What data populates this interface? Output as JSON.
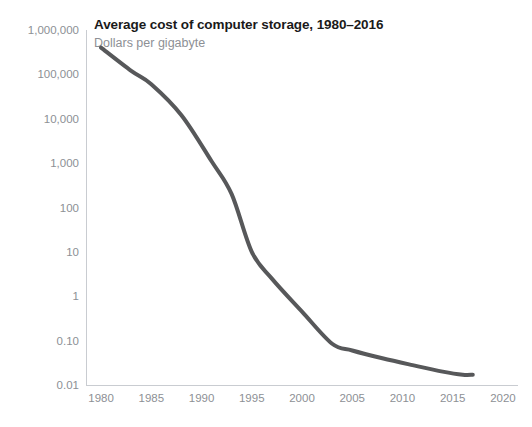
{
  "chart_data": {
    "type": "line",
    "title": "Average cost of computer storage, 1980–2016",
    "subtitle": "Dollars per gigabyte",
    "xlabel": "",
    "ylabel": "",
    "yscale": "log",
    "ylim": [
      0.01,
      1000000
    ],
    "xlim": [
      1978.5,
      2021.5
    ],
    "grid": false,
    "legend": null,
    "line_color": "#57585a",
    "line_width": 4,
    "y_ticks": [
      {
        "value": 1000000,
        "label": "1,000,000"
      },
      {
        "value": 100000,
        "label": "100,000"
      },
      {
        "value": 10000,
        "label": "10,000"
      },
      {
        "value": 1000,
        "label": "1,000"
      },
      {
        "value": 100,
        "label": "100"
      },
      {
        "value": 10,
        "label": "10"
      },
      {
        "value": 1,
        "label": "1"
      },
      {
        "value": 0.1,
        "label": "0.10"
      },
      {
        "value": 0.01,
        "label": "0.01"
      }
    ],
    "x_ticks": [
      {
        "value": 1980,
        "label": "1980"
      },
      {
        "value": 1985,
        "label": "1985"
      },
      {
        "value": 1990,
        "label": "1990"
      },
      {
        "value": 1995,
        "label": "1995"
      },
      {
        "value": 2000,
        "label": "2000"
      },
      {
        "value": 2005,
        "label": "2005"
      },
      {
        "value": 2010,
        "label": "2010"
      },
      {
        "value": 2015,
        "label": "2015"
      },
      {
        "value": 2020,
        "label": "2020"
      }
    ],
    "series": [
      {
        "name": "Average cost per gigabyte",
        "x": [
          1980,
          1983,
          1985,
          1988,
          1991,
          1993,
          1995,
          1997,
          2000,
          2003,
          2005,
          2008,
          2011,
          2014,
          2016,
          2017
        ],
        "y": [
          400000,
          120000,
          60000,
          12000,
          1100,
          200,
          10,
          2.5,
          0.45,
          0.085,
          0.06,
          0.04,
          0.028,
          0.02,
          0.017,
          0.017
        ]
      }
    ]
  }
}
